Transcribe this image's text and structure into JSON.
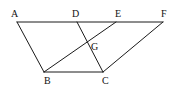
{
  "diagram": {
    "points": {
      "A": {
        "x": 17,
        "y": 22
      },
      "D": {
        "x": 77,
        "y": 22
      },
      "E": {
        "x": 116,
        "y": 22
      },
      "F": {
        "x": 163,
        "y": 22
      },
      "B": {
        "x": 44,
        "y": 72
      },
      "C": {
        "x": 103,
        "y": 72
      },
      "G": {
        "x": 88,
        "y": 43
      }
    },
    "labels": {
      "A": "A",
      "D": "D",
      "E": "E",
      "F": "F",
      "B": "B",
      "C": "C",
      "G": "G"
    },
    "segments": [
      [
        "A",
        "F"
      ],
      [
        "A",
        "B"
      ],
      [
        "B",
        "C"
      ],
      [
        "D",
        "C"
      ],
      [
        "B",
        "E"
      ],
      [
        "C",
        "F"
      ]
    ],
    "line_color": "#1a1a1a"
  }
}
